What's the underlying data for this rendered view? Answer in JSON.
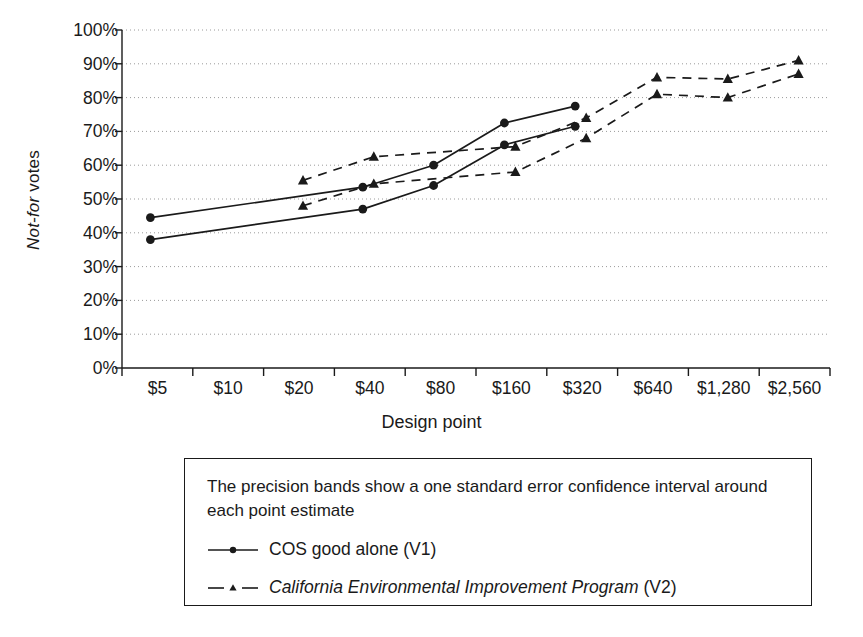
{
  "chart_data": {
    "type": "line",
    "title": "",
    "xlabel": "Design point",
    "ylabel_italic": "Not-for",
    "ylabel_plain": " votes",
    "ylabel": "Not-for votes",
    "categories": [
      "$5",
      "$10",
      "$20",
      "$40",
      "$80",
      "$160",
      "$320",
      "$640",
      "$1,280",
      "$2,560"
    ],
    "ytick_labels": [
      "100%",
      "90%",
      "80%",
      "70%",
      "60%",
      "50%",
      "40%",
      "30%",
      "20%",
      "10%",
      "0%"
    ],
    "ytick_values": [
      100,
      90,
      80,
      70,
      60,
      50,
      40,
      30,
      20,
      10,
      0
    ],
    "ylim": [
      0,
      100
    ],
    "grid": "horizontal-dotted",
    "legend_position": "below-plot-boxed",
    "series": [
      {
        "name": "COS good alone (V1)",
        "marker": "circle",
        "line": "solid",
        "band": "one standard error",
        "x": [
          "$5",
          "$40",
          "$80",
          "$160",
          "$320"
        ],
        "upper": [
          44.5,
          53.5,
          60.0,
          72.5,
          77.5
        ],
        "lower": [
          38.0,
          47.0,
          54.0,
          66.0,
          71.5
        ]
      },
      {
        "name": "California Environmental Improvement Program (V2)",
        "marker": "triangle",
        "line": "dashed",
        "band": "one standard error",
        "x": [
          "$20",
          "$40",
          "$160",
          "$320",
          "$640",
          "$1,280",
          "$2,560"
        ],
        "upper": [
          55.5,
          62.5,
          65.5,
          74.0,
          86.0,
          85.5,
          91.0
        ],
        "lower": [
          48.0,
          54.5,
          58.0,
          68.0,
          81.0,
          80.0,
          87.0
        ]
      }
    ]
  },
  "axes": {
    "x_title": "Design point"
  },
  "legend": {
    "note": "The precision bands show a one standard error confidence interval around each point estimate",
    "entries": [
      {
        "label": "COS good alone (V1)",
        "label_italic": "",
        "label_plain": "COS good alone (V1)",
        "marker": "circle",
        "line": "solid"
      },
      {
        "label": "California Environmental Improvement Program (V2)",
        "label_italic": "California Environmental Improvement Program",
        "label_plain": " (V2)",
        "marker": "triangle",
        "line": "dashed"
      }
    ]
  },
  "colors": {
    "ink": "#1a1a1a",
    "grid": "#9a9a9a",
    "background": "#ffffff"
  }
}
